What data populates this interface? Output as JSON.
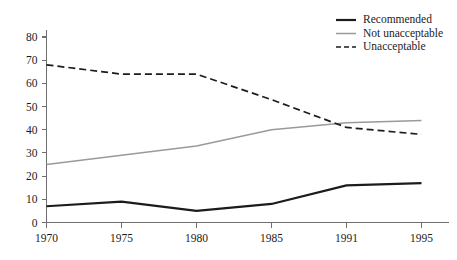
{
  "chart_data": {
    "type": "line",
    "title": "",
    "subtitle": "",
    "xlabel": "",
    "ylabel": "",
    "x": [
      "1970",
      "1975",
      "1980",
      "1985",
      "1991",
      "1995"
    ],
    "categories": [
      "1970",
      "1975",
      "1980",
      "1985",
      "1991",
      "1995"
    ],
    "xtick_labels": [
      "1970",
      "1975",
      "1980",
      "1985",
      "1991",
      "1995"
    ],
    "ytick_labels": [
      "0",
      "10",
      "20",
      "30",
      "40",
      "50",
      "60",
      "70",
      "80"
    ],
    "ytick_values": [
      0,
      10,
      20,
      30,
      40,
      50,
      60,
      70,
      80
    ],
    "ylim": [
      0,
      80
    ],
    "grid": false,
    "legend_position": "top-right",
    "series": [
      {
        "name": "Recommended",
        "values": [
          7,
          9,
          5,
          8,
          16,
          17
        ],
        "color": "#1c1c1c",
        "style": "solid",
        "width": 2.2
      },
      {
        "name": "Not unacceptable",
        "values": [
          25,
          29,
          33,
          40,
          43,
          44
        ],
        "color": "#9a9a9a",
        "style": "solid",
        "width": 1.5
      },
      {
        "name": "Unacceptable",
        "values": [
          68,
          64,
          64,
          53,
          41,
          38
        ],
        "color": "#1c1c1c",
        "style": "dashed",
        "width": 1.7
      }
    ]
  },
  "legend": {
    "entries": [
      {
        "label": "Recommended"
      },
      {
        "label": "Not unacceptable"
      },
      {
        "label": "Unacceptable"
      }
    ]
  },
  "axes": {
    "y_labels": [
      "80",
      "70",
      "60",
      "50",
      "40",
      "30",
      "20",
      "10",
      "0"
    ],
    "x_labels": [
      "1970",
      "1975",
      "1980",
      "1985",
      "1991",
      "1995"
    ]
  },
  "colors": {
    "axis": "#6f6f6f",
    "text": "#1c1c1c",
    "series_recommended": "#1c1c1c",
    "series_not_unacceptable": "#9a9a9a",
    "series_unacceptable": "#1c1c1c",
    "background": "#ffffff"
  }
}
